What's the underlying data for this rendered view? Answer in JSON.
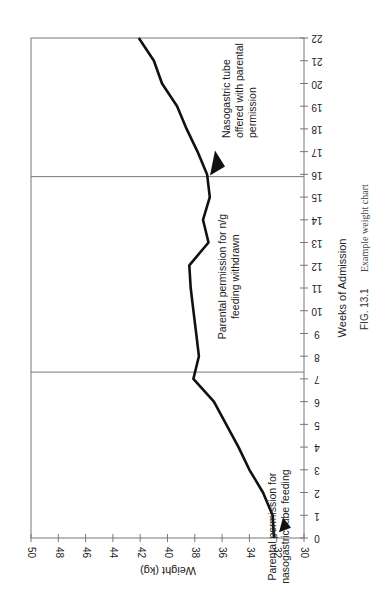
{
  "chart_data": {
    "type": "line",
    "orientation": "rotated 90° (weeks run vertically bottom-to-top, weight axis horizontal reversed)",
    "title": "",
    "xlabel": "Weeks of Admission",
    "ylabel": "Weight (kg)",
    "xlim": [
      0,
      22
    ],
    "ylim": [
      30,
      50
    ],
    "x_ticks": [
      0,
      1,
      2,
      3,
      4,
      5,
      6,
      7,
      8,
      9,
      10,
      11,
      12,
      13,
      14,
      15,
      16,
      17,
      18,
      19,
      20,
      21,
      22
    ],
    "y_ticks": [
      30,
      32,
      34,
      36,
      38,
      40,
      42,
      44,
      46,
      48,
      50
    ],
    "grid": false,
    "series": [
      {
        "name": "Weight",
        "x": [
          0,
          1,
          2,
          3,
          4,
          5,
          6,
          7,
          8,
          9,
          10,
          11,
          12,
          13,
          14,
          15,
          16,
          17,
          18,
          19,
          20,
          21,
          22
        ],
        "values": [
          32.2,
          32.3,
          33.0,
          34.0,
          34.8,
          35.7,
          36.6,
          38.1,
          37.7,
          37.9,
          38.1,
          38.3,
          38.4,
          37.0,
          37.4,
          36.9,
          37.1,
          37.8,
          38.6,
          39.3,
          40.4,
          41.0,
          42.1
        ]
      }
    ],
    "vertical_markers": [
      7.3,
      15.9
    ],
    "annotations": [
      {
        "week": 0.5,
        "lines": [
          "Parental permission for",
          "nasogastric tube feeding"
        ],
        "arrow": true
      },
      {
        "week": 11.5,
        "lines": [
          "Parental permission for n/g",
          "feeding withdrawn"
        ],
        "arrow": false
      },
      {
        "week": 16.5,
        "lines": [
          "Nasogastric tube",
          "offered with parental",
          "permission"
        ],
        "arrow": true
      }
    ]
  },
  "caption": {
    "figure_label": "FIG. 13.1",
    "text": "Example weight chart"
  },
  "colors": {
    "line": "#111111",
    "frame": "#777777",
    "text": "#222222"
  }
}
